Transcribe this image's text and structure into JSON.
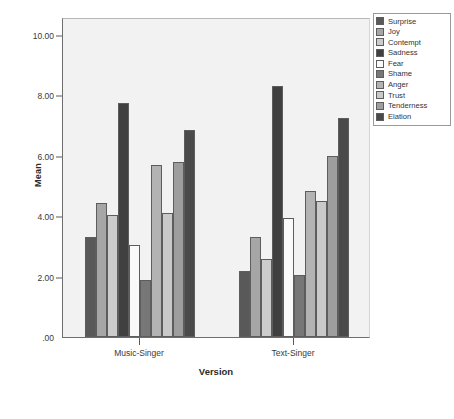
{
  "chart_data": {
    "type": "bar",
    "title": "",
    "xlabel": "Version",
    "ylabel": "Mean",
    "categories": [
      "Music-Singer",
      "Text-Singer"
    ],
    "ylim": [
      0.0,
      10.6
    ],
    "yticks": [
      0.0,
      2.0,
      4.0,
      6.0,
      8.0,
      10.0
    ],
    "ytick_labels": [
      ".00",
      "2.00",
      "4.00",
      "6.00",
      "8.00",
      "10.00"
    ],
    "grid": false,
    "legend_position": "right",
    "series": [
      {
        "name": "Surprise",
        "color": "#595959",
        "values": [
          3.3,
          2.2
        ]
      },
      {
        "name": "Joy",
        "color": "#a6a6a6",
        "values": [
          4.45,
          3.3
        ]
      },
      {
        "name": "Contempt",
        "color": "#cccccc",
        "values": [
          4.05,
          2.6
        ]
      },
      {
        "name": "Sadness",
        "color": "#404040",
        "values": [
          7.75,
          8.3
        ]
      },
      {
        "name": "Fear",
        "color": "#fafafa",
        "values": [
          3.05,
          3.95
        ]
      },
      {
        "name": "Shame",
        "color": "#777777",
        "values": [
          1.9,
          2.05
        ]
      },
      {
        "name": "Anger",
        "color": "#b3b3b3",
        "values": [
          5.7,
          4.85
        ]
      },
      {
        "name": "Trust",
        "color": "#c9c9c9",
        "values": [
          4.1,
          4.5
        ]
      },
      {
        "name": "Tenderness",
        "color": "#9e9e9e",
        "values": [
          5.8,
          6.0
        ]
      },
      {
        "name": "Elation",
        "color": "#4a4a4a",
        "values": [
          6.85,
          7.25
        ]
      }
    ]
  },
  "colors": {
    "plot_background": "#f2f2f2",
    "page_background": "#ffffff",
    "axis": "#6e6e6e",
    "text": "#333333"
  }
}
